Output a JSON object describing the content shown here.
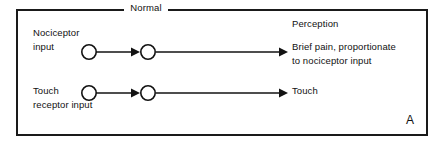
{
  "figure": {
    "panel_letter": "A",
    "frame_title": "Normal",
    "column_heading": "Perception",
    "rows": [
      {
        "input_label": "Nociceptor\ninput",
        "output_label": "Brief pain, proportionate\nto nociceptor input",
        "nodes": [
          "first-order-neuron",
          "second-order-neuron"
        ],
        "connector": "arrow-right"
      },
      {
        "input_label": "Touch\nreceptor input",
        "output_label": "Touch",
        "nodes": [
          "first-order-neuron",
          "second-order-neuron"
        ],
        "connector": "arrow-right"
      }
    ],
    "colors": {
      "stroke": "#121212",
      "background": "#ffffff",
      "text": "#111111"
    }
  }
}
